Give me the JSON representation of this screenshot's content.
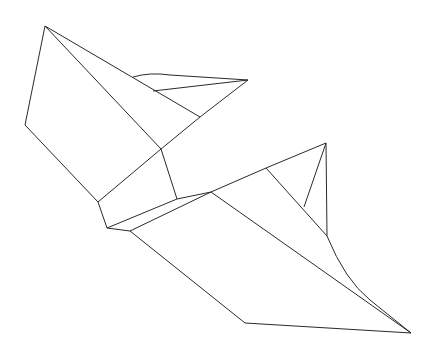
{
  "canvas": {
    "width": 434,
    "height": 357,
    "background": "#ffffff",
    "stroke": "#2a2a2a"
  },
  "drawing": {
    "title": "Folded paper shape line drawing",
    "segments": [
      [
        45,
        26,
        25,
        125
      ],
      [
        25,
        125,
        98,
        202
      ],
      [
        45,
        26,
        161,
        149
      ],
      [
        45,
        26,
        200,
        117
      ],
      [
        200,
        117,
        248,
        80
      ],
      [
        161,
        149,
        200,
        117
      ],
      [
        161,
        149,
        98,
        202
      ],
      [
        161,
        149,
        177,
        199
      ],
      [
        98,
        202,
        107,
        228
      ],
      [
        107,
        228,
        177,
        199
      ],
      [
        107,
        228,
        130,
        231
      ],
      [
        130,
        231,
        211,
        192
      ],
      [
        177,
        199,
        211,
        192
      ],
      [
        153,
        91,
        248,
        80
      ],
      [
        211,
        192,
        266,
        168
      ],
      [
        266,
        168,
        326,
        143
      ],
      [
        326,
        143,
        304,
        207
      ],
      [
        326,
        143,
        327,
        236
      ],
      [
        266,
        168,
        327,
        236
      ],
      [
        211,
        192,
        411,
        333
      ],
      [
        130,
        231,
        245,
        323
      ],
      [
        245,
        323,
        411,
        333
      ]
    ],
    "paths": [
      "M133,77 Q150,72 170,75 L248,80",
      "M327,236 Q345,280 370,300 L411,333"
    ]
  }
}
